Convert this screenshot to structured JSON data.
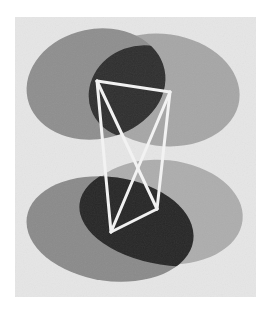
{
  "image": {
    "description": "Grayscale photograph of two pairs of overlapping translucent capsule shapes with a white wire tetrahedral frame",
    "background": "#ffffff",
    "panel": {
      "x": 15,
      "y": 17,
      "w": 241,
      "h": 280,
      "color": "#e6e6e6"
    },
    "capsules": [
      {
        "name": "top-left-capsule",
        "cx": 96,
        "cy": 84,
        "rx": 70,
        "ry": 55,
        "rot": -12,
        "color": "#8e8e8e"
      },
      {
        "name": "top-right-capsule",
        "cx": 163,
        "cy": 90,
        "rx": 77,
        "ry": 56,
        "rot": 8,
        "color": "#a6a6a6"
      },
      {
        "name": "bottom-right-capsule",
        "cx": 164,
        "cy": 212,
        "rx": 79,
        "ry": 52,
        "rot": 6,
        "color": "#adadad"
      },
      {
        "name": "bottom-left-capsule",
        "cx": 110,
        "cy": 229,
        "rx": 84,
        "ry": 52,
        "rot": 8,
        "color": "#8a8a8a"
      }
    ],
    "overlaps": [
      {
        "name": "top-overlap",
        "color": "#2e2e2e"
      },
      {
        "name": "bottom-overlap",
        "color": "#262626"
      }
    ],
    "frame": {
      "color": "#f2f2f2",
      "width": 3,
      "vertices": {
        "A": [
          97,
          81
        ],
        "B": [
          170,
          92
        ],
        "C": [
          111,
          232
        ],
        "D": [
          157,
          209
        ]
      },
      "edges": [
        [
          "A",
          "B"
        ],
        [
          "A",
          "C"
        ],
        [
          "A",
          "D"
        ],
        [
          "B",
          "C"
        ],
        [
          "B",
          "D"
        ],
        [
          "C",
          "D"
        ]
      ]
    }
  }
}
